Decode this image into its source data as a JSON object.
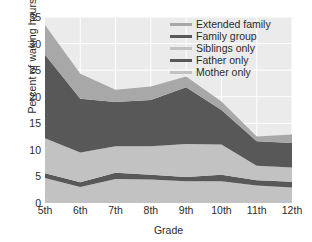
{
  "chart_data": {
    "type": "area",
    "stacked": true,
    "title": "",
    "xlabel": "Grade",
    "ylabel": "Percent of waking hours",
    "categories": [
      "5th",
      "6th",
      "7th",
      "8th",
      "9th",
      "10th",
      "11th",
      "12th"
    ],
    "ylim": [
      0,
      35
    ],
    "yticks": [
      0,
      5,
      10,
      15,
      20,
      25,
      30,
      35
    ],
    "grid": true,
    "legend_position": "upper right",
    "series": [
      {
        "name": "Mother only",
        "color": "#c2c2c2",
        "values": [
          4.7,
          3.0,
          4.5,
          4.4,
          4.1,
          4.1,
          3.3,
          2.9
        ]
      },
      {
        "name": "Father only",
        "color": "#585859",
        "values": [
          0.9,
          0.9,
          1.2,
          0.9,
          0.8,
          1.2,
          1.0,
          1.1
        ]
      },
      {
        "name": "Siblings only",
        "color": "#c2c2c2",
        "values": [
          6.6,
          5.6,
          5.0,
          5.4,
          6.2,
          5.7,
          2.7,
          2.7
        ]
      },
      {
        "name": "Family group",
        "color": "#585859",
        "values": [
          15.7,
          10.1,
          8.3,
          8.7,
          10.7,
          6.5,
          4.6,
          4.6
        ]
      },
      {
        "name": "Extended family",
        "color": "#a8a8a8",
        "values": [
          5.6,
          4.7,
          2.3,
          2.5,
          2.0,
          1.6,
          0.9,
          1.6
        ]
      }
    ],
    "totals": [
      33.5,
      24.3,
      21.3,
      21.9,
      23.8,
      19.1,
      12.5,
      12.9
    ]
  },
  "legend": {
    "items": [
      {
        "label": "Extended family",
        "color": "#a8a8a8",
        "thickness": "3px"
      },
      {
        "label": "Family group",
        "color": "#585859",
        "thickness": "3px"
      },
      {
        "label": "Siblings only",
        "color": "#c2c2c2",
        "thickness": "3px"
      },
      {
        "label": "Father only",
        "color": "#585859",
        "thickness": "3px"
      },
      {
        "label": "Mother only",
        "color": "#c2c2c2",
        "thickness": "3px"
      }
    ]
  },
  "style": {
    "plot_background": "#ebebeb",
    "grid_color": "#ffffff",
    "text_color": "#2b2b2b",
    "page_background": "#ffffff"
  }
}
